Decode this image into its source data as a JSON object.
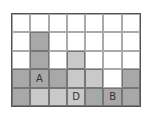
{
  "diagram": {
    "rows": 5,
    "cols": 7,
    "colors": {
      "w": "#ffffff",
      "d": "#a8a8a8",
      "l": "#c9c9c9"
    },
    "cells": [
      [
        "w",
        "w",
        "w",
        "w",
        "w",
        "w",
        "w"
      ],
      [
        "w",
        "d",
        "w",
        "w",
        "w",
        "w",
        "w"
      ],
      [
        "w",
        "d",
        "w",
        "l",
        "w",
        "w",
        "w"
      ],
      [
        "d",
        "d",
        "d",
        "l",
        "l",
        "w",
        "d"
      ],
      [
        "d",
        "l",
        "l",
        "l",
        "d",
        "d",
        "d"
      ]
    ],
    "labels": [
      {
        "row": 3,
        "col": 1,
        "text": "A"
      },
      {
        "row": 4,
        "col": 5,
        "text": "B"
      },
      {
        "row": 4,
        "col": 3,
        "text": "D"
      }
    ]
  }
}
